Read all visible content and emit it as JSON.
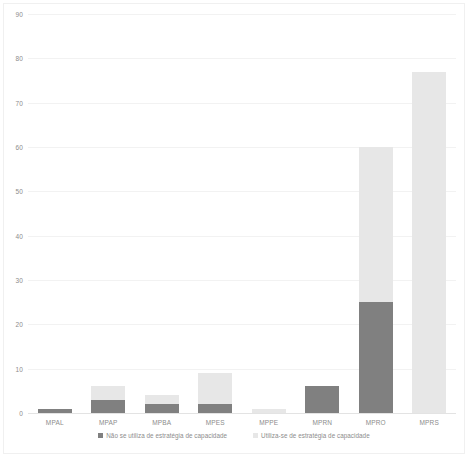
{
  "chart_data": {
    "type": "bar",
    "title": "",
    "subtitle": "",
    "xlabel": "",
    "ylabel": "",
    "stacked": true,
    "grid": true,
    "legend_position": "bottom",
    "ylim": [
      0,
      90
    ],
    "yticks": [
      0,
      10,
      20,
      30,
      40,
      50,
      60,
      70,
      80,
      90
    ],
    "ytick_labels": [
      "0",
      "10",
      "20",
      "30",
      "40",
      "50",
      "60",
      "70",
      "80",
      "90"
    ],
    "categories": [
      "MPAL",
      "MPAP",
      "MPBA",
      "MPES",
      "MPPE",
      "MPRN",
      "MPRO",
      "MPRS"
    ],
    "series": [
      {
        "name": "Não se utiliza de estratégia de capacidade",
        "color": "#808080",
        "values": [
          1,
          3,
          2,
          2,
          0,
          6,
          25,
          0
        ]
      },
      {
        "name": "Utiliza-se de estratégia de capacidade",
        "color": "#e7e7e7",
        "values": [
          0,
          3,
          2,
          7,
          1,
          0,
          35,
          77
        ]
      }
    ],
    "totals": [
      1,
      6,
      4,
      9,
      1,
      6,
      60,
      77
    ]
  },
  "legend": {
    "entries": [
      {
        "label": "Não se utiliza de estratégia de capacidade",
        "swatch": "dark"
      },
      {
        "label": "Utiliza-se de estratégia de capacidade",
        "swatch": "light"
      }
    ]
  }
}
